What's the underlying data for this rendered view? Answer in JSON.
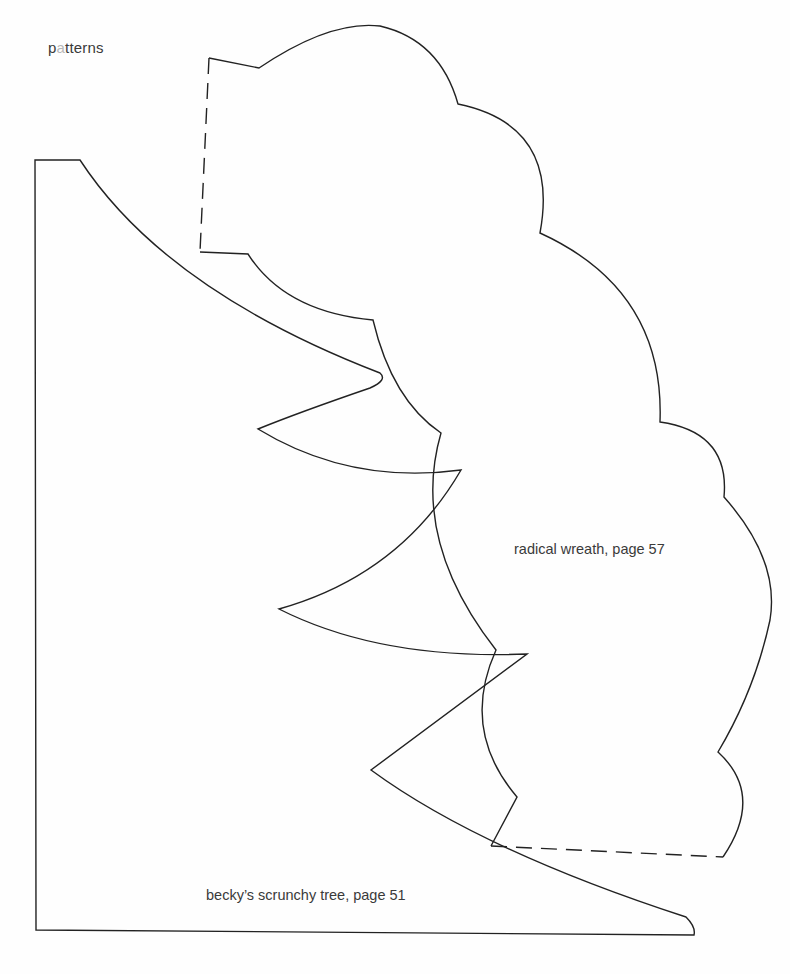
{
  "header": {
    "title_prefix": "p",
    "title_highlight": "a",
    "title_suffix": "tterns",
    "title_full": "patterns"
  },
  "patterns": [
    {
      "id": "radical-wreath",
      "label": "radical wreath, page 57",
      "outline": "solid with dashed fold lines"
    },
    {
      "id": "beckys-scrunchy-tree",
      "label": "becky’s scrunchy tree, page 51",
      "outline": "solid"
    }
  ],
  "colors": {
    "background": "#fefefe",
    "line": "#222222",
    "text": "#3a3a3a",
    "highlight_letter": "#b8b8b8"
  }
}
